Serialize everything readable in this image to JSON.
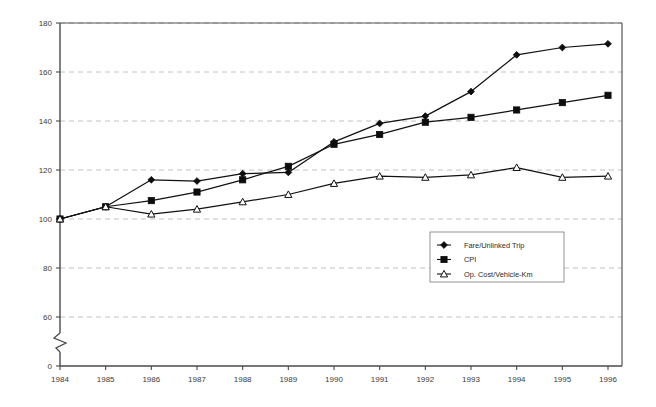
{
  "chart_data": {
    "type": "line",
    "title": "",
    "subtitle": "",
    "xlabel": "",
    "ylabel": "",
    "categories": [
      "1984",
      "1985",
      "1986",
      "1987",
      "1988",
      "1989",
      "1990",
      "1991",
      "1992",
      "1993",
      "1994",
      "1995",
      "1996"
    ],
    "x": [
      1984,
      1985,
      1986,
      1987,
      1988,
      1989,
      1990,
      1991,
      1992,
      1993,
      1994,
      1995,
      1996
    ],
    "series": [
      {
        "name": "Fare/Unlinked Trip",
        "marker": "filled-diamond",
        "values": [
          100,
          105,
          116,
          115.5,
          118.5,
          119,
          131.5,
          139,
          142,
          152,
          167,
          170,
          171.5
        ]
      },
      {
        "name": "CPI",
        "marker": "filled-square",
        "values": [
          100,
          105,
          107.5,
          111,
          116,
          121.5,
          130.5,
          134.5,
          139.5,
          141.5,
          144.5,
          147.5,
          150.5
        ]
      },
      {
        "name": "Op. Cost/Vehicle-Km",
        "marker": "open-triangle",
        "values": [
          100,
          105,
          102,
          104,
          107,
          110,
          114.5,
          117.5,
          117,
          118,
          121,
          117,
          117.5
        ]
      }
    ],
    "ylim": [
      0,
      180
    ],
    "y_ticks": [
      0,
      60,
      80,
      100,
      120,
      140,
      160,
      180
    ],
    "y_tick_labels": [
      "0",
      "60",
      "80",
      "100",
      "120",
      "140",
      "160",
      "180"
    ],
    "y_axis_break": {
      "present": true,
      "between": [
        0,
        60
      ]
    },
    "grid": {
      "horizontal": true,
      "vertical": false,
      "style": "dashed"
    },
    "legend": {
      "position": "inside-center-lower",
      "entries": [
        "Fare/Unlinked Trip",
        "CPI",
        "Op. Cost/Vehicle-Km"
      ]
    },
    "colors": {
      "line": "#111111",
      "grid": "#b9b9c4",
      "axis": "#4a4a4a",
      "background": "#ffffff"
    }
  }
}
